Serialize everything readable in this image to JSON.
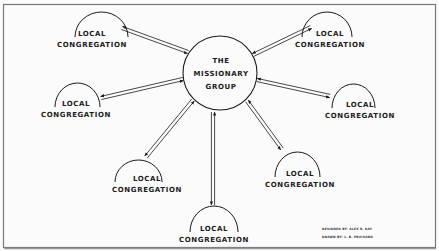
{
  "diagram": {
    "center": {
      "lines": [
        "THE",
        "MISSIONARY",
        "GROUP"
      ],
      "cx": 220,
      "cy": 73,
      "r": 37
    },
    "nodes": [
      {
        "id": "top-left",
        "lines": [
          "LOCAL",
          "CONGREGATION"
        ],
        "label_x": 92,
        "label_y": 33,
        "arc_x1": 75,
        "arc_x2": 128,
        "arc_top": 12
      },
      {
        "id": "top-right",
        "lines": [
          "LOCAL",
          "CONGREGATION"
        ],
        "label_x": 330,
        "label_y": 33,
        "arc_x1": 302,
        "arc_x2": 352,
        "arc_top": 12
      },
      {
        "id": "mid-left",
        "lines": [
          "LOCAL",
          "CONGREGATION"
        ],
        "label_x": 76,
        "label_y": 103,
        "arc_x1": 55,
        "arc_x2": 100,
        "arc_top": 83
      },
      {
        "id": "mid-right",
        "lines": [
          "LOCAL",
          "CONGREGATION"
        ],
        "label_x": 360,
        "label_y": 104,
        "arc_x1": 332,
        "arc_x2": 375,
        "arc_top": 84
      },
      {
        "id": "low-left",
        "lines": [
          "LOCAL",
          "CONGREGATION"
        ],
        "label_x": 147,
        "label_y": 178,
        "arc_x1": 115,
        "arc_x2": 162,
        "arc_top": 160
      },
      {
        "id": "low-right",
        "lines": [
          "LOCAL",
          "CONGREGATION"
        ],
        "label_x": 300,
        "label_y": 173,
        "arc_x1": 275,
        "arc_x2": 320,
        "arc_top": 152
      },
      {
        "id": "bottom",
        "lines": [
          "LOCAL",
          "CONGREGATION"
        ],
        "label_x": 214,
        "label_y": 228,
        "arc_x1": 190,
        "arc_x2": 238,
        "arc_top": 206
      }
    ],
    "connectors": [
      {
        "to": "top-left",
        "x1": 188,
        "y1": 52,
        "x2": 122,
        "y2": 28
      },
      {
        "to": "top-right",
        "x1": 253,
        "y1": 55,
        "x2": 311,
        "y2": 27
      },
      {
        "to": "mid-left",
        "x1": 183,
        "y1": 79,
        "x2": 101,
        "y2": 98
      },
      {
        "to": "mid-right",
        "x1": 257,
        "y1": 80,
        "x2": 330,
        "y2": 96
      },
      {
        "to": "low-left",
        "x1": 193,
        "y1": 100,
        "x2": 146,
        "y2": 157
      },
      {
        "to": "low-right",
        "x1": 247,
        "y1": 101,
        "x2": 282,
        "y2": 149
      },
      {
        "to": "bottom",
        "x1": 213,
        "y1": 112,
        "x2": 213,
        "y2": 205
      }
    ],
    "credits": {
      "line1": "DESIGNED BY: ALEX R. KAY",
      "line2": "DRAWN BY: L. B. PRICHARD"
    },
    "colors": {
      "ink": "#1a1a1a",
      "paper": "#fbfbfb",
      "frame": "#777777"
    }
  }
}
